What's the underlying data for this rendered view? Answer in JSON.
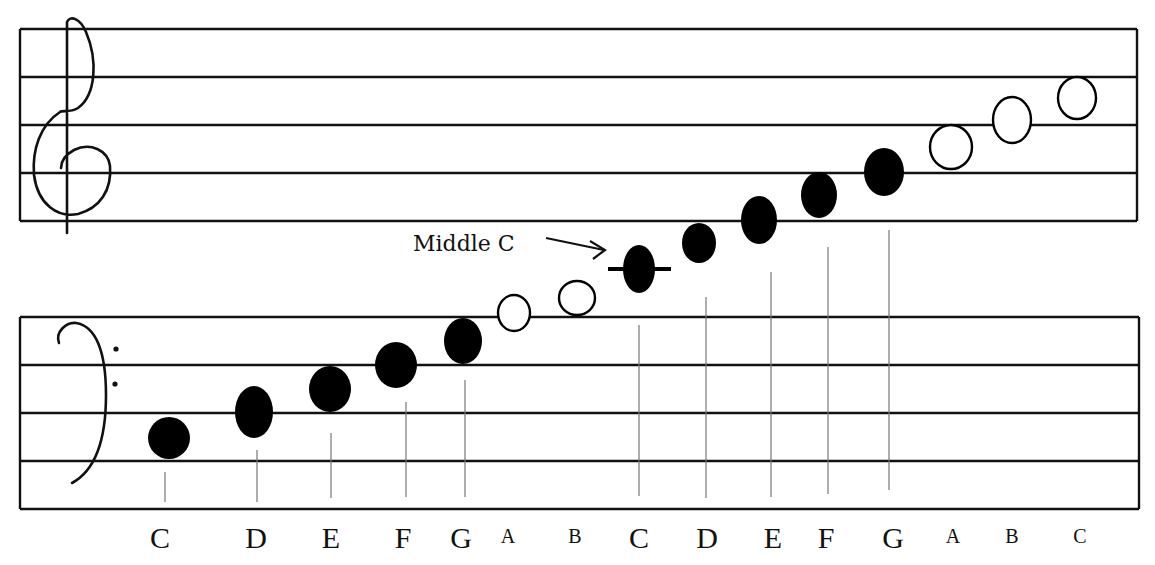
{
  "title": "",
  "annotation": {
    "text": "Middle C",
    "target_note_index": 7
  },
  "staves": {
    "treble": {
      "clef": "treble-clef",
      "line_y": [
        29,
        77,
        125,
        173,
        221
      ],
      "x_start": 20,
      "x_end": 1137
    },
    "bass": {
      "clef": "bass-clef",
      "line_y": [
        317,
        365,
        413,
        461,
        509
      ],
      "x_start": 20,
      "x_end": 1139
    }
  },
  "notes": [
    {
      "name": "C",
      "x": 169,
      "y": 438,
      "rx": 21,
      "ry": 21,
      "filled": true,
      "label_size": "big"
    },
    {
      "name": "D",
      "x": 254,
      "y": 412,
      "rx": 19,
      "ry": 26,
      "filled": true,
      "label_size": "big"
    },
    {
      "name": "E",
      "x": 330,
      "y": 389,
      "rx": 21,
      "ry": 23,
      "filled": true,
      "label_size": "big"
    },
    {
      "name": "F",
      "x": 396,
      "y": 365,
      "rx": 21,
      "ry": 23,
      "filled": true,
      "label_size": "big"
    },
    {
      "name": "G",
      "x": 463,
      "y": 341,
      "rx": 19,
      "ry": 23,
      "filled": true,
      "label_size": "big"
    },
    {
      "name": "A",
      "x": 514,
      "y": 313,
      "rx": 16,
      "ry": 18,
      "filled": false,
      "label_size": "small"
    },
    {
      "name": "B",
      "x": 577,
      "y": 298,
      "rx": 18,
      "ry": 17,
      "filled": false,
      "label_size": "small"
    },
    {
      "name": "C",
      "x": 639,
      "y": 269,
      "rx": 16,
      "ry": 24,
      "filled": true,
      "label_size": "big",
      "ledger": true
    },
    {
      "name": "D",
      "x": 699,
      "y": 243,
      "rx": 17,
      "ry": 20,
      "filled": true,
      "label_size": "big"
    },
    {
      "name": "E",
      "x": 759,
      "y": 220,
      "rx": 18,
      "ry": 24,
      "filled": true,
      "label_size": "big"
    },
    {
      "name": "F",
      "x": 819,
      "y": 195,
      "rx": 18,
      "ry": 23,
      "filled": true,
      "label_size": "big"
    },
    {
      "name": "G",
      "x": 884,
      "y": 172,
      "rx": 20,
      "ry": 24,
      "filled": true,
      "label_size": "big"
    },
    {
      "name": "A",
      "x": 951,
      "y": 147,
      "rx": 21,
      "ry": 22,
      "filled": false,
      "label_size": "small"
    },
    {
      "name": "B",
      "x": 1012,
      "y": 120,
      "rx": 19,
      "ry": 23,
      "filled": false,
      "label_size": "small"
    },
    {
      "name": "C",
      "x": 1077,
      "y": 98,
      "rx": 19,
      "ry": 21,
      "filled": false,
      "label_size": "small"
    }
  ],
  "labels": [
    {
      "text": "C",
      "x": 160,
      "size": "big"
    },
    {
      "text": "D",
      "x": 256,
      "size": "big"
    },
    {
      "text": "E",
      "x": 331,
      "size": "big"
    },
    {
      "text": "F",
      "x": 403,
      "size": "big"
    },
    {
      "text": "G",
      "x": 461,
      "size": "big"
    },
    {
      "text": "A",
      "x": 508,
      "size": "small"
    },
    {
      "text": "B",
      "x": 575,
      "size": "small"
    },
    {
      "text": "C",
      "x": 639,
      "size": "big"
    },
    {
      "text": "D",
      "x": 707,
      "size": "big"
    },
    {
      "text": "E",
      "x": 773,
      "size": "big"
    },
    {
      "text": "F",
      "x": 826,
      "size": "big"
    },
    {
      "text": "G",
      "x": 893,
      "size": "big"
    },
    {
      "text": "A",
      "x": 953,
      "size": "small"
    },
    {
      "text": "B",
      "x": 1012,
      "size": "small"
    },
    {
      "text": "C",
      "x": 1080,
      "size": "small"
    }
  ],
  "stems": [
    {
      "x": 165,
      "y1": 472,
      "y2": 502
    },
    {
      "x": 257,
      "y1": 450,
      "y2": 502
    },
    {
      "x": 331,
      "y1": 433,
      "y2": 498
    },
    {
      "x": 406,
      "y1": 402,
      "y2": 497
    },
    {
      "x": 465,
      "y1": 380,
      "y2": 497
    },
    {
      "x": 639,
      "y1": 325,
      "y2": 496
    },
    {
      "x": 706,
      "y1": 297,
      "y2": 498
    },
    {
      "x": 771,
      "y1": 272,
      "y2": 497
    },
    {
      "x": 828,
      "y1": 247,
      "y2": 494
    },
    {
      "x": 889,
      "y1": 230,
      "y2": 490
    }
  ],
  "colors": {
    "ink": "#111111",
    "stem": "#777777",
    "background": "#ffffff"
  }
}
